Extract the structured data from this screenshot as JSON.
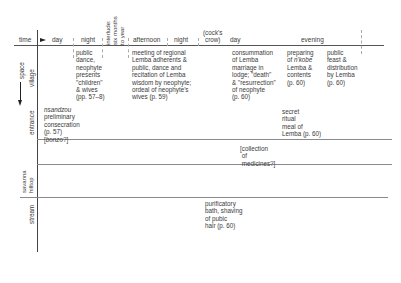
{
  "axes": {
    "time_label": "time",
    "space_label": "space"
  },
  "time_columns": [
    {
      "label": "day"
    },
    {
      "label": "night"
    },
    {
      "label": "interlude:\nsix months\nto year"
    },
    {
      "label": "afternoon"
    },
    {
      "label": "night"
    },
    {
      "label": "(cock's\ncrow)"
    },
    {
      "label": "day"
    },
    {
      "label": "evening"
    }
  ],
  "space_rows": [
    {
      "label": "village"
    },
    {
      "label": "entrance"
    },
    {
      "label": "savanna\nhilltop"
    },
    {
      "label": "stream"
    }
  ],
  "events": {
    "village_night": "public\ndance,\nneophyte\npresents\n\"children\"\n& wives\n(pp. 57–8)",
    "village_afternoon": "meeting of regional\nLemba adherents &\npublic, dance and\nrecitation of Lemba\nwisdom by neophyte;\nordeal of neophyte's\nwives (p. 59)",
    "village_day2": "consummation\nof Lemba\nmarriage in\nlodge; \"death\"\n& \"resurrection\"\nof neophyte\n(p. 60)",
    "village_evening_1_pre": "preparing\nof ",
    "village_evening_1_ital": "n'kobe",
    "village_evening_1_post": "\nLemba &\ncontents\n(p. 60)",
    "village_evening_2": "public\nfeast &\ndistribution\nby Lemba\n(p. 60)",
    "entrance_day_ital": "nsandzou",
    "entrance_day": "preliminary\nconsecration\n(p. 57)",
    "entrance_day_bonzo": "[bonzo?]",
    "entrance_evening": "secret\nritual\nmeal of\nLemba (p. 60)",
    "hilltop_day2": "[collection\n of\n medicines?]",
    "stream_day2": "purificatory\nbath, shaving\nof pubic\nhair (p. 60)"
  }
}
